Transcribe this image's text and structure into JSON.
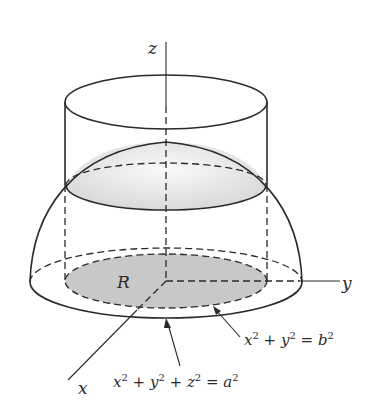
{
  "figure": {
    "type": "3d-solid-diagram",
    "colors": {
      "stroke": "#2a2a2a",
      "region_fill": "#c8c8c8",
      "cap_fill": "#e6e6e6",
      "background": "#ffffff"
    },
    "axes": {
      "z_label": "z",
      "y_label": "y",
      "x_label": "x"
    },
    "region_label": "R",
    "annotations": {
      "cylinder_eq": {
        "lhs_a": "x",
        "exp_a": "2",
        "plus": " + ",
        "lhs_b": "y",
        "exp_b": "2",
        "eq": " = ",
        "rhs": "b",
        "exp_rhs": "2",
        "full_text": "x² + y² = b²"
      },
      "sphere_eq": {
        "lhs_a": "x",
        "exp_a": "2",
        "plus1": " + ",
        "lhs_b": "y",
        "exp_b": "2",
        "plus2": " + ",
        "lhs_c": "z",
        "exp_c": "2",
        "eq": " = ",
        "rhs": "a",
        "exp_rhs": "2",
        "full_text": "x² + y² + z² = a²"
      }
    }
  }
}
